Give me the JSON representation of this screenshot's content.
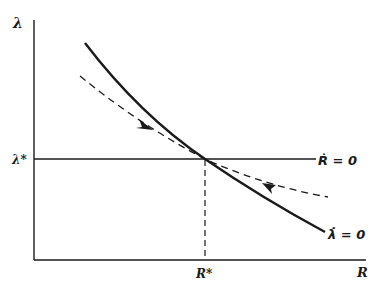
{
  "diagram": {
    "type": "phase-diagram",
    "axes": {
      "y_label": "λ",
      "x_label": "R"
    },
    "steady_state": {
      "lambda_label": "λ*",
      "r_label": "R*"
    },
    "curves": [
      {
        "name": "lambda-dot-zero",
        "style": "solid",
        "label": "λ̇ = 0"
      },
      {
        "name": "r-dot-zero-line",
        "style": "solid-horizontal",
        "label": "Ṙ = 0"
      },
      {
        "name": "saddle-path",
        "style": "dashed",
        "arrows": [
          "toward-steady-state-from-upper-left",
          "toward-steady-state-from-lower-right"
        ]
      }
    ],
    "colors": {
      "ink": "#1a1a1a",
      "background": "#ffffff"
    }
  }
}
